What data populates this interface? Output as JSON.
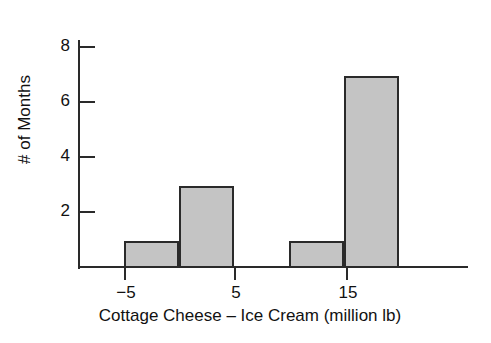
{
  "chart_data": {
    "type": "bar",
    "title": "",
    "subtitle": "",
    "xlabel": "Cottage Cheese – Ice Cream (million lb)",
    "ylabel": "# of Months",
    "grid": false,
    "legend": null,
    "xlim": [
      -10,
      24
    ],
    "ylim": [
      0,
      8.4
    ],
    "x_ticks": [
      -5,
      5,
      15
    ],
    "x_tick_labels": [
      "−5",
      "5",
      "15"
    ],
    "y_ticks": [
      2,
      4,
      6,
      8
    ],
    "y_tick_labels": [
      "2",
      "4",
      "6",
      "8"
    ],
    "bin_width": 5,
    "bins": [
      {
        "label": "−5 to 0",
        "x_start": -5,
        "x_end": 0,
        "value": 1
      },
      {
        "label": "0 to 5",
        "x_start": 0,
        "x_end": 5,
        "value": 3
      },
      {
        "label": "5 to 10",
        "x_start": 5,
        "x_end": 10,
        "value": 0
      },
      {
        "label": "10 to 15",
        "x_start": 10,
        "x_end": 15,
        "value": 1
      },
      {
        "label": "15 to 20",
        "x_start": 15,
        "x_end": 20,
        "value": 7
      }
    ],
    "categories": [
      "−5 to 0",
      "0 to 5",
      "5 to 10",
      "10 to 15",
      "15 to 20"
    ],
    "values": [
      1,
      3,
      0,
      1,
      7
    ],
    "colors": {
      "bar_fill": "#c4c4c4",
      "bar_edge": "#2a2a2a",
      "axis": "#2a2a2a",
      "text": "#111111",
      "background": "#ffffff"
    }
  }
}
